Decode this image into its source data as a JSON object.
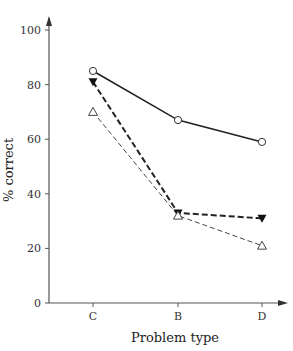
{
  "chart_data": {
    "type": "line",
    "title": "",
    "xlabel": "Problem type",
    "ylabel": "% correct",
    "categories": [
      "C",
      "B",
      "D"
    ],
    "ylim": [
      0,
      100
    ],
    "yticks": [
      0,
      20,
      40,
      60,
      80,
      100
    ],
    "grid": false,
    "legend": null,
    "series": [
      {
        "name": "open-circle-solid",
        "marker": "open-circle",
        "line": "solid",
        "values": [
          85,
          67,
          59
        ]
      },
      {
        "name": "filled-triangle-bold-dashed",
        "marker": "filled-down-triangle",
        "line": "bold-dashed",
        "values": [
          81,
          33,
          31
        ]
      },
      {
        "name": "open-triangle-thin-dashed",
        "marker": "open-up-triangle",
        "line": "thin-dashed",
        "values": [
          70,
          32,
          21
        ]
      }
    ]
  },
  "axes": {
    "x_label": "Problem type",
    "y_label": "% correct",
    "x_ticks": [
      "C",
      "B",
      "D"
    ],
    "y_ticks": [
      "0",
      "20",
      "40",
      "60",
      "80",
      "100"
    ]
  }
}
